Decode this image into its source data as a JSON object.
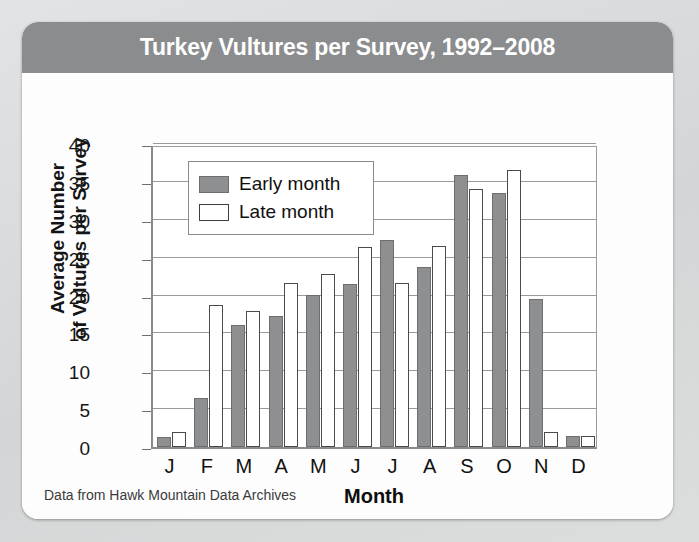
{
  "card": {
    "title": "Turkey Vultures per Survey, 1992–2008",
    "header_color": "#8b8c8e",
    "source_note": "Data from Hawk Mountain Data Archives"
  },
  "legend": {
    "position": "top-left-inside-plot",
    "entries": [
      {
        "label": "Early month",
        "swatch": "early-month-swatch",
        "color": "#8e8f90"
      },
      {
        "label": "Late month",
        "swatch": "late-month-swatch",
        "color": "#ffffff"
      }
    ]
  },
  "chart_data": {
    "type": "bar",
    "title": "Turkey Vultures per Survey, 1992–2008",
    "xlabel": "Month",
    "ylabel": "Average Number\nof Vultures per Survey",
    "ylabel_line1": "Average Number",
    "ylabel_line2": "of Vultures per Survey",
    "categories": [
      "J",
      "F",
      "M",
      "A",
      "M",
      "J",
      "J",
      "A",
      "S",
      "O",
      "N",
      "D"
    ],
    "series": [
      {
        "name": "Early month",
        "color": "#8e8f90",
        "values": [
          1.3,
          6.5,
          16.1,
          17.3,
          20.1,
          21.5,
          27.3,
          23.7,
          35.9,
          33.5,
          19.5,
          1.5
        ]
      },
      {
        "name": "Late month",
        "color": "#ffffff",
        "values": [
          2.0,
          18.8,
          18.0,
          21.7,
          22.8,
          26.4,
          21.6,
          26.5,
          34.1,
          36.6,
          2.0,
          1.5
        ]
      }
    ],
    "ylim": [
      0,
      40
    ],
    "yticks": [
      0,
      5,
      10,
      15,
      20,
      25,
      30,
      35,
      40
    ],
    "grid": true,
    "legend_position": "upper left"
  }
}
